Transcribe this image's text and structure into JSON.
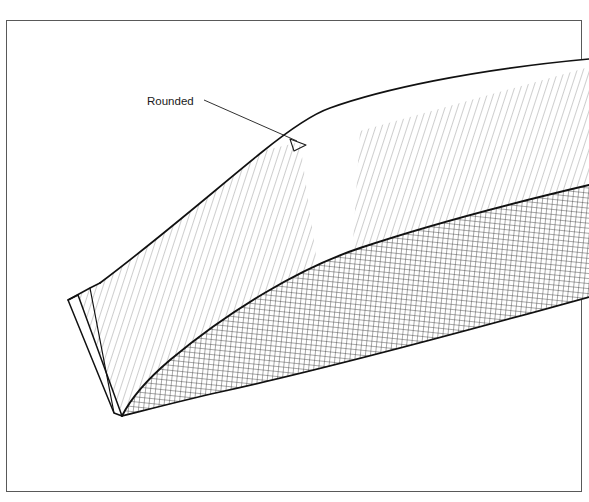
{
  "figure": {
    "name": "technical-line-drawing",
    "title_partial": "Rails for Tapering",
    "background_color": "#ffffff",
    "frame": {
      "name": "figure-border",
      "stroke_color": "#4a4a4a",
      "stroke_width": 1,
      "x": 6,
      "y": 20,
      "width": 576,
      "height": 472
    },
    "annotations": [
      {
        "name": "rounded-callout",
        "label": "Rounded",
        "label_x": 147,
        "label_y": 104,
        "leader_start_x": 205,
        "leader_start_y": 101,
        "leader_end_x": 299,
        "leader_end_y": 143,
        "arrowhead": "open-triangle",
        "stroke_color": "#1a1a1a"
      }
    ],
    "solid": {
      "name": "tapered-wedge-body",
      "outline_color": "#000000",
      "outline_width": 1.6,
      "faces": [
        {
          "name": "top-face-left-hatched",
          "fill": "hatch-diagonal",
          "hatch_angle_deg": 72,
          "hatch_color": "#9a9a9a"
        },
        {
          "name": "top-face-center-plain",
          "fill": "none",
          "hatch_color": "#ffffff"
        },
        {
          "name": "top-face-right-hatched",
          "fill": "hatch-diagonal",
          "hatch_angle_deg": 72,
          "hatch_color": "#9a9a9a"
        },
        {
          "name": "side-face-crosshatched",
          "fill": "crosshatch-grid",
          "hatch_color": "#333333"
        },
        {
          "name": "end-face-left-edge",
          "fill": "none",
          "hatch_color": "#ffffff"
        }
      ]
    }
  }
}
